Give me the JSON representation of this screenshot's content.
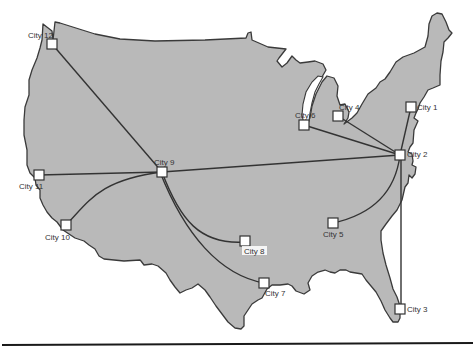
{
  "figure": {
    "type": "network-map",
    "region": "contiguous United States",
    "colors": {
      "land": "#b9b9b9",
      "border": "#3a3a3a",
      "edge": "#333333",
      "node_fill": "#ffffff",
      "background": "#ffffff"
    }
  },
  "cities": [
    {
      "id": "city-1",
      "label": "City 1",
      "x": 411,
      "y": 107
    },
    {
      "id": "city-2",
      "label": "City 2",
      "x": 400,
      "y": 155
    },
    {
      "id": "city-3",
      "label": "City 3",
      "x": 400,
      "y": 309
    },
    {
      "id": "city-4",
      "label": "City 4",
      "x": 338,
      "y": 116
    },
    {
      "id": "city-5",
      "label": "City 5",
      "x": 333,
      "y": 223
    },
    {
      "id": "city-6",
      "label": "City 6",
      "x": 304,
      "y": 125
    },
    {
      "id": "city-7",
      "label": "City 7",
      "x": 264,
      "y": 283
    },
    {
      "id": "city-8",
      "label": "City 8",
      "x": 245,
      "y": 241
    },
    {
      "id": "city-9",
      "label": "City 9",
      "x": 162,
      "y": 172
    },
    {
      "id": "city-10",
      "label": "City 10",
      "x": 66,
      "y": 225
    },
    {
      "id": "city-11",
      "label": "City 11",
      "x": 39,
      "y": 175
    },
    {
      "id": "city-12",
      "label": "City 12",
      "x": 52,
      "y": 44
    }
  ],
  "connections": [
    {
      "from": "City 12",
      "to": "City 9",
      "shape": "straight"
    },
    {
      "from": "City 11",
      "to": "City 9",
      "shape": "straight"
    },
    {
      "from": "City 10",
      "to": "City 9",
      "shape": "curved"
    },
    {
      "from": "City 9",
      "to": "City 8",
      "shape": "curved"
    },
    {
      "from": "City 9",
      "to": "City 7",
      "shape": "curved"
    },
    {
      "from": "City 9",
      "to": "City 2",
      "shape": "straight"
    },
    {
      "from": "City 6",
      "to": "City 2",
      "shape": "straight"
    },
    {
      "from": "City 4",
      "to": "City 2",
      "shape": "straight"
    },
    {
      "from": "City 1",
      "to": "City 2",
      "shape": "straight"
    },
    {
      "from": "City 2",
      "to": "City 5",
      "shape": "curved"
    },
    {
      "from": "City 2",
      "to": "City 3",
      "shape": "straight"
    }
  ],
  "labels": {
    "city_1": "City 1",
    "city_2": "City 2",
    "city_3": "City 3",
    "city_4": "City 4",
    "city_5": "City 5",
    "city_6": "City 6",
    "city_7": "City 7",
    "city_8": "City 8",
    "city_9": "City 9",
    "city_10": "City 10",
    "city_11": "City 11",
    "city_12": "City 12"
  }
}
